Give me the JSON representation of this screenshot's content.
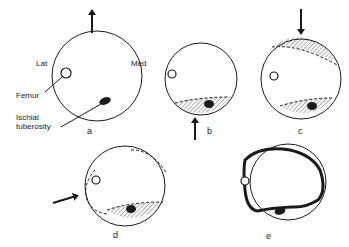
{
  "figure": {
    "panels": [
      {
        "id": "a",
        "label": "a"
      },
      {
        "id": "b",
        "label": "b"
      },
      {
        "id": "c",
        "label": "c"
      },
      {
        "id": "d",
        "label": "d"
      },
      {
        "id": "e",
        "label": "e"
      }
    ],
    "annotations": {
      "lateral": "Lat",
      "medial": "Med",
      "femur": "Femur",
      "ischial_line1": "Ischial",
      "ischial_line2": "tuberosity"
    }
  },
  "colors": {
    "ink": "#1a1a1a",
    "hatch": "#9a9a9a",
    "background": "#ffffff"
  }
}
